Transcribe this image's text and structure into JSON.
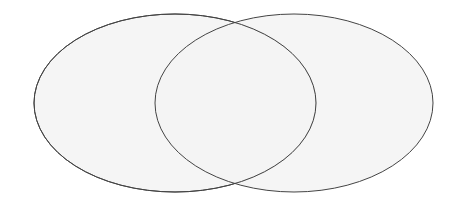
{
  "diagram": {
    "type": "venn",
    "background": "#ffffff",
    "fill": "#f3f3f3",
    "stroke": "#444444",
    "stroke_width": 1,
    "sets": [
      {
        "name": "set-a",
        "label": "",
        "cx": 175,
        "cy": 103,
        "rx": 141,
        "ry": 89
      },
      {
        "name": "set-b",
        "label": "",
        "cx": 294,
        "cy": 103,
        "rx": 139,
        "ry": 89
      }
    ]
  }
}
